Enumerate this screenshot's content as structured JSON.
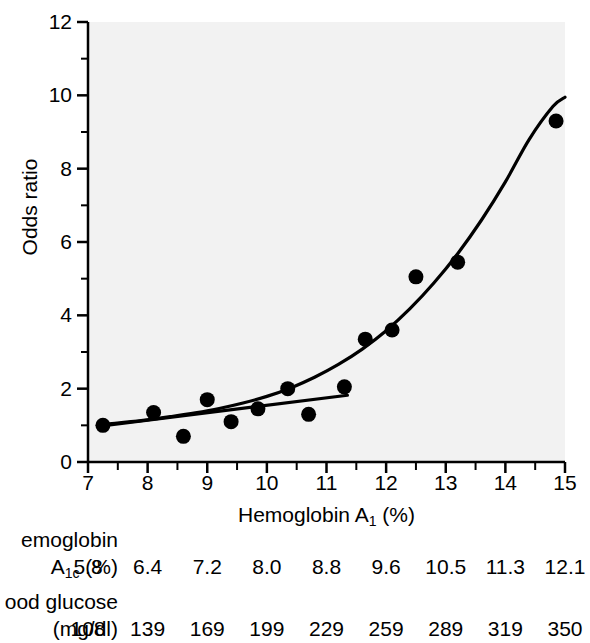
{
  "chart_data": {
    "type": "scatter",
    "title": "",
    "xlabel": "Hemoglobin A1 (%)",
    "ylabel": "Odds ratio",
    "xlim": [
      7,
      15
    ],
    "ylim": [
      0,
      12
    ],
    "xticks": [
      "7",
      "8",
      "9",
      "10",
      "11",
      "12",
      "13",
      "14",
      "15"
    ],
    "yticks": [
      "0",
      "2",
      "4",
      "6",
      "8",
      "10",
      "12"
    ],
    "x_minor_tick_step": 0.5,
    "y_minor_tick_step": 1,
    "grid": false,
    "legend": "none",
    "plot_background": "#f2f2f2",
    "marker_color": "#000000",
    "line_color": "#000000",
    "points": [
      {
        "x": 7.25,
        "y": 1.0
      },
      {
        "x": 8.1,
        "y": 1.35
      },
      {
        "x": 8.6,
        "y": 0.7
      },
      {
        "x": 9.0,
        "y": 1.7
      },
      {
        "x": 9.4,
        "y": 1.1
      },
      {
        "x": 9.85,
        "y": 1.45
      },
      {
        "x": 10.35,
        "y": 2.0
      },
      {
        "x": 10.7,
        "y": 1.3
      },
      {
        "x": 11.3,
        "y": 2.05
      },
      {
        "x": 11.65,
        "y": 3.35
      },
      {
        "x": 12.1,
        "y": 3.6
      },
      {
        "x": 12.5,
        "y": 5.05
      },
      {
        "x": 13.2,
        "y": 5.45
      },
      {
        "x": 14.85,
        "y": 9.3
      }
    ],
    "series": [
      {
        "name": "exponential fit",
        "type": "line",
        "x": [
          7.2,
          7.6,
          8.0,
          8.4,
          8.8,
          9.2,
          9.6,
          10.0,
          10.4,
          10.8,
          11.2,
          11.6,
          12.0,
          12.4,
          12.8,
          13.2,
          13.6,
          14.0,
          14.4,
          14.8,
          15.0
        ],
        "y": [
          1.02,
          1.08,
          1.15,
          1.24,
          1.34,
          1.46,
          1.61,
          1.79,
          2.02,
          2.31,
          2.66,
          3.08,
          3.58,
          4.18,
          4.88,
          5.68,
          6.6,
          7.64,
          8.8,
          9.7,
          9.95
        ]
      },
      {
        "name": "linear fit",
        "type": "line",
        "x": [
          7.2,
          11.35
        ],
        "y": [
          0.98,
          1.82
        ]
      }
    ]
  },
  "axes": {
    "y_title": "Odds ratio",
    "x_title_main": "Hemoglobin A",
    "x_title_sub": "1",
    "x_title_tail": " (%)",
    "ytick_labels": [
      "12",
      "10",
      "8",
      "6",
      "4",
      "2",
      "0"
    ],
    "xtick_labels": [
      "7",
      "8",
      "9",
      "10",
      "11",
      "12",
      "13",
      "14",
      "15"
    ]
  },
  "conversion_table": {
    "row1": {
      "title": "emoglobin",
      "label_main": "A",
      "label_sub": "1c",
      "label_tail": " (%)",
      "values": [
        "5.8",
        "6.4",
        "7.2",
        "8.0",
        "8.8",
        "9.6",
        "10.5",
        "11.3",
        "12.1"
      ]
    },
    "row2": {
      "title": "ood glucose",
      "label": "(mg/dl)",
      "values": [
        "108",
        "139",
        "169",
        "199",
        "229",
        "259",
        "289",
        "319",
        "350"
      ]
    }
  }
}
